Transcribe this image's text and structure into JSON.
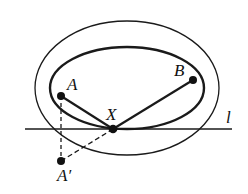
{
  "diagram": {
    "type": "geometry",
    "colors": {
      "stroke": "#1a1a1a",
      "background": "#ffffff"
    },
    "outer_ellipse": {
      "cx": 127,
      "cy": 88,
      "rx": 92,
      "ry": 67,
      "stroke_width": 1.3
    },
    "inner_ellipse": {
      "cx": 127,
      "cy": 88,
      "rx": 77,
      "ry": 41,
      "stroke_width": 2.4
    },
    "line": {
      "label": "l",
      "y": 129,
      "x1": 25,
      "x2": 232,
      "label_x": 226,
      "label_y": 123
    },
    "points": [
      {
        "id": "A",
        "label": "A",
        "x": 61,
        "y": 96,
        "label_x": 67,
        "label_y": 90
      },
      {
        "id": "B",
        "label": "B",
        "x": 193,
        "y": 80,
        "label_x": 174,
        "label_y": 76
      },
      {
        "id": "X",
        "label": "X",
        "x": 113,
        "y": 129,
        "label_x": 106,
        "label_y": 120
      },
      {
        "id": "A_prime",
        "label": "A′",
        "x": 61,
        "y": 161,
        "label_x": 57,
        "label_y": 181
      }
    ],
    "segments": [
      {
        "from": "A",
        "to": "X",
        "style": "solid"
      },
      {
        "from": "X",
        "to": "B",
        "style": "solid"
      },
      {
        "from": "A",
        "to": "A_prime",
        "style": "dashed"
      },
      {
        "from": "A_prime",
        "to": "X",
        "style": "dashed"
      }
    ]
  }
}
